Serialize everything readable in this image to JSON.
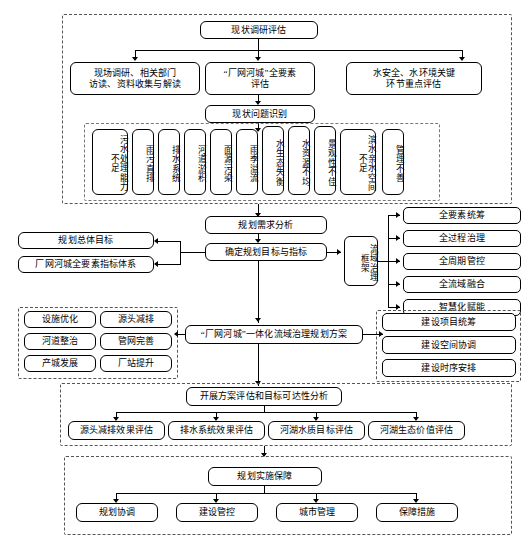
{
  "diagram": {
    "title_visible": false,
    "type": "flowchart",
    "sections": [
      {
        "id": "status-survey",
        "head": "现状调研评估",
        "row2": [
          "现场调研、相关部门\n访读、资料收集与解读",
          "“厂网河城”全要素\n评估",
          "水安全、水环境关键\n环节重点评估"
        ],
        "mid": "现状问题识别",
        "problems": [
          "污水处理能力不足",
          "雨污直排",
          "排水系统",
          "河道淤积",
          "面源污染",
          "雨季溢流",
          "水生态失衡",
          "水资源不均",
          "景观性不佳",
          "滨水亲水空间不足",
          "管理不善"
        ]
      },
      {
        "id": "planning",
        "demand": "规划需求分析",
        "target": "确定规划目标与指标",
        "left_targets": [
          "规划总体目标",
          "厂网河城全要素指标体系"
        ],
        "framework": "流域治理框架",
        "framework_items": [
          "全要素统筹",
          "全过程治理",
          "全周期管控",
          "全流域融合",
          "智慧化赋能"
        ]
      },
      {
        "id": "scheme",
        "center": "“厂网河城”一体化流域治理规划方案",
        "left_grid": [
          "设施优化",
          "源头减排",
          "河道整治",
          "管网完善",
          "产城发展",
          "厂站提升"
        ],
        "right_list": [
          "建设项目统筹",
          "建设空间协调",
          "建设时序安排"
        ]
      },
      {
        "id": "assessment",
        "head": "开展方案评估和目标可达性分析",
        "items": [
          "源头减排效果评估",
          "排水系统效果评估",
          "河湖水质目标评估",
          "河湖生态价值评估"
        ]
      },
      {
        "id": "implementation",
        "head": "规划实施保障",
        "items": [
          "规划协调",
          "建设管控",
          "城市管理",
          "保障措施"
        ]
      }
    ]
  },
  "colors": {
    "background": "#ffffff",
    "line": "#000000",
    "group_border": "#555555",
    "box_fill": "#ffffff"
  }
}
